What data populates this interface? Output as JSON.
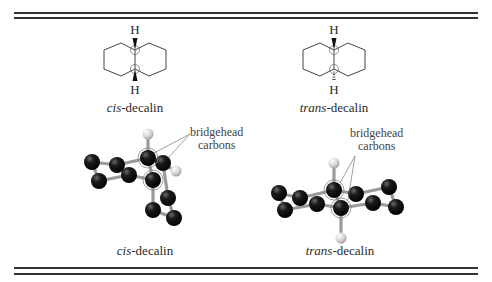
{
  "figure": {
    "panels": [
      {
        "id": "cis-skeletal",
        "top_atom": "H",
        "bottom_atom": "H",
        "label_prefix": "cis",
        "label_suffix": "-decalin",
        "top_bond": "wedge",
        "bottom_bond": "wedge"
      },
      {
        "id": "trans-skeletal",
        "top_atom": "H",
        "bottom_atom": "H",
        "label_prefix": "trans",
        "label_suffix": "-decalin",
        "top_bond": "wedge",
        "bottom_bond": "hashed"
      },
      {
        "id": "cis-model",
        "annotation_line1": "bridgehead",
        "annotation_line2": "carbons",
        "label_prefix": "cis",
        "label_suffix": "-decalin"
      },
      {
        "id": "trans-model",
        "annotation_line1": "bridgehead",
        "annotation_line2": "carbons",
        "label_prefix": "trans",
        "label_suffix": "-decalin"
      }
    ],
    "colors": {
      "rule": "#333333",
      "carbon": "#111111",
      "hydrogen": "#d8d8d8",
      "bond": "#9a9a9a",
      "text": "#2a2a2a"
    }
  }
}
